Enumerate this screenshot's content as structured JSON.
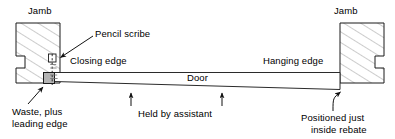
{
  "diagram": {
    "type": "technical-line-drawing",
    "colors": {
      "line": "#1a1a1a",
      "hatch": "#8a8a8a",
      "waste_fill": "#b3b3b3",
      "background": "#ffffff",
      "text": "#000000"
    },
    "labels": {
      "jamb_left": "Jamb",
      "jamb_right": "Jamb",
      "pencil_scribe": "Pencil scribe",
      "closing_edge": "Closing edge",
      "hanging_edge": "Hanging edge",
      "door": "Door",
      "waste_line1": "Waste, plus",
      "waste_line2": "leading edge",
      "held_by_assistant": "Held by assistant",
      "positioned_line1": "Positioned just",
      "positioned_line2": "inside rebate"
    },
    "parts": [
      {
        "name": "jamb-left",
        "label": "Jamb",
        "description": "Left door jamb section with rebate notch, hatched"
      },
      {
        "name": "jamb-right",
        "label": "Jamb",
        "description": "Right door jamb section with rebate notch, hatched"
      },
      {
        "name": "door-panel",
        "label": "Door",
        "description": "Tapered door panel spanning between jambs"
      },
      {
        "name": "waste-block",
        "label": "Waste, plus leading edge",
        "description": "Grey shaded waste at closing edge"
      },
      {
        "name": "pencil-scribe-mark",
        "label": "Pencil scribe",
        "description": "Scribe line marked on closing edge"
      }
    ],
    "annotations": [
      {
        "name": "pencil-scribe",
        "text": "Pencil scribe",
        "pointer": "arrow-down-left"
      },
      {
        "name": "closing-edge",
        "text": "Closing edge",
        "pointer": "none"
      },
      {
        "name": "hanging-edge",
        "text": "Hanging edge",
        "pointer": "none"
      },
      {
        "name": "waste-plus-leading-edge",
        "text": "Waste, plus leading edge",
        "pointer": "arrow-up-right"
      },
      {
        "name": "held-by-assistant",
        "text": "Held by assistant",
        "pointer": "two-up-arrows"
      },
      {
        "name": "positioned-inside-rebate",
        "text": "Positioned just inside rebate",
        "pointer": "arrow-up-right-curved"
      }
    ]
  }
}
